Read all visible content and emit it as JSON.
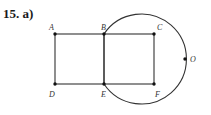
{
  "problem_label": "15. a)",
  "figure": {
    "type": "geometry-diagram",
    "points": [
      {
        "name": "A",
        "x": 55,
        "y": 34
      },
      {
        "name": "B",
        "x": 104,
        "y": 34
      },
      {
        "name": "C",
        "x": 154,
        "y": 34
      },
      {
        "name": "D",
        "x": 55,
        "y": 84
      },
      {
        "name": "E",
        "x": 104,
        "y": 84
      },
      {
        "name": "F",
        "x": 154,
        "y": 84
      },
      {
        "name": "O",
        "x": 185,
        "y": 59
      }
    ],
    "segments": [
      [
        "A",
        "B"
      ],
      [
        "B",
        "C"
      ],
      [
        "C",
        "F"
      ],
      [
        "F",
        "E"
      ],
      [
        "E",
        "D"
      ],
      [
        "D",
        "A"
      ],
      [
        "B",
        "E"
      ]
    ],
    "circle": {
      "cx": 141,
      "cy": 59,
      "r": 45,
      "passes_through": [
        "B",
        "O",
        "E"
      ]
    },
    "line_color": "#333333"
  },
  "labels": {
    "A": "A",
    "B": "B",
    "C": "C",
    "D": "D",
    "E": "E",
    "F": "F",
    "O": "O"
  }
}
